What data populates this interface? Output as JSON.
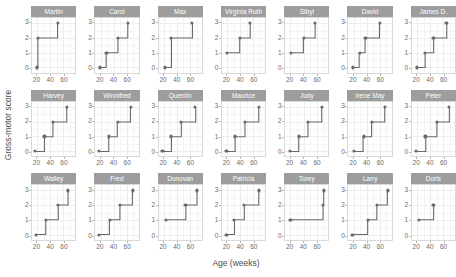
{
  "axes": {
    "y_title": "Gross-motor score",
    "x_title": "Age (weeks)",
    "y_ticks": [
      "0",
      "1",
      "2",
      "3"
    ],
    "y_tick_values": [
      0,
      1,
      2,
      3
    ],
    "x_ticks": [
      "20",
      "40",
      "60"
    ],
    "x_tick_values": [
      20,
      40,
      60
    ],
    "xlim": [
      12,
      78
    ],
    "ylim": [
      -0.35,
      3.35
    ]
  },
  "style": {
    "strip_bg": "#9d9d9d",
    "strip_text": "#ffffff",
    "panel_border": "#d9d9d9",
    "grid_major": "#ececec",
    "grid_minor": "#f4f4f4",
    "line_color": "#696969",
    "point_color": "#696969",
    "axis_text": "#6b6b6b",
    "title_text": "#4d4d4d"
  },
  "chart_data": {
    "type": "line",
    "title": "",
    "subtitle": "",
    "xlabel": "Age (weeks)",
    "ylabel": "Gross-motor score",
    "xlim": [
      12,
      78
    ],
    "ylim": [
      -0.35,
      3.35
    ],
    "grid": true,
    "legend": "none",
    "facet_layout": {
      "rows": 3,
      "cols": 7
    },
    "step_type": "hv",
    "annotations": [],
    "series": [
      {
        "name": "Martin",
        "row": 0,
        "col": 0,
        "x": [
          19,
          21,
          51
        ],
        "values": [
          0,
          2,
          3
        ]
      },
      {
        "name": "Carol",
        "row": 0,
        "col": 1,
        "x": [
          19,
          29,
          47,
          62
        ],
        "values": [
          0,
          1,
          2,
          3
        ]
      },
      {
        "name": "Max",
        "row": 0,
        "col": 2,
        "x": [
          22,
          31,
          63
        ],
        "values": [
          0,
          2,
          3
        ]
      },
      {
        "name": "Virginia Ruth",
        "row": 0,
        "col": 3,
        "x": [
          20,
          39,
          55
        ],
        "values": [
          1,
          2,
          3
        ]
      },
      {
        "name": "Sibyl",
        "row": 0,
        "col": 4,
        "x": [
          21,
          40,
          58
        ],
        "values": [
          1,
          2,
          3
        ]
      },
      {
        "name": "David",
        "row": 0,
        "col": 5,
        "x": [
          19,
          29,
          38,
          60
        ],
        "values": [
          0,
          1,
          2,
          3
        ]
      },
      {
        "name": "James D.",
        "row": 0,
        "col": 6,
        "x": [
          20,
          32,
          45,
          65
        ],
        "values": [
          0,
          1,
          2,
          3
        ]
      },
      {
        "name": "Harvey",
        "row": 1,
        "col": 0,
        "x": [
          17,
          31,
          44,
          65
        ],
        "values": [
          0,
          1,
          2,
          3
        ]
      },
      {
        "name": "Winnifred",
        "row": 1,
        "col": 1,
        "x": [
          18,
          33,
          46,
          66
        ],
        "values": [
          0,
          1,
          2,
          3
        ]
      },
      {
        "name": "Quentin",
        "row": 1,
        "col": 2,
        "x": [
          18,
          31,
          46,
          68
        ],
        "values": [
          0,
          1,
          2,
          3
        ]
      },
      {
        "name": "Maurice",
        "row": 1,
        "col": 3,
        "x": [
          19,
          32,
          47,
          68
        ],
        "values": [
          0,
          1,
          2,
          3
        ]
      },
      {
        "name": "Judy",
        "row": 1,
        "col": 4,
        "x": [
          19,
          33,
          47,
          68
        ],
        "values": [
          0,
          1,
          2,
          3
        ]
      },
      {
        "name": "Irene May",
        "row": 1,
        "col": 5,
        "x": [
          20,
          35,
          48,
          68
        ],
        "values": [
          0,
          1,
          2,
          3
        ]
      },
      {
        "name": "Peter",
        "row": 1,
        "col": 6,
        "x": [
          19,
          33,
          50,
          69
        ],
        "values": [
          0,
          1,
          2,
          3
        ]
      },
      {
        "name": "Walley",
        "row": 2,
        "col": 0,
        "x": [
          18,
          33,
          52,
          67
        ],
        "values": [
          0,
          1,
          2,
          3
        ]
      },
      {
        "name": "Fred",
        "row": 2,
        "col": 1,
        "x": [
          18,
          34,
          50,
          69
        ],
        "values": [
          0,
          1,
          2,
          3
        ]
      },
      {
        "name": "Donovan",
        "row": 2,
        "col": 2,
        "x": [
          23,
          53,
          70
        ],
        "values": [
          1,
          2,
          3
        ]
      },
      {
        "name": "Patricia",
        "row": 2,
        "col": 3,
        "x": [
          19,
          31,
          46,
          68
        ],
        "values": [
          0,
          1,
          2,
          3
        ]
      },
      {
        "name": "Torey",
        "row": 2,
        "col": 4,
        "x": [
          20,
          70,
          71
        ],
        "values": [
          1,
          2,
          3
        ]
      },
      {
        "name": "Larry",
        "row": 2,
        "col": 5,
        "x": [
          18,
          42,
          56,
          72
        ],
        "values": [
          0,
          1,
          2,
          3
        ]
      },
      {
        "name": "Doris",
        "row": 2,
        "col": 6,
        "x": [
          23,
          45
        ],
        "values": [
          1,
          2
        ]
      }
    ]
  }
}
